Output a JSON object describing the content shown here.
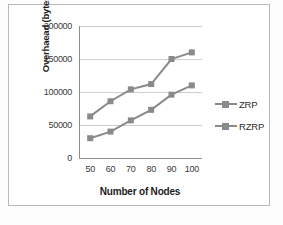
{
  "chart_data": {
    "type": "line",
    "title": "",
    "xlabel": "Number of Nodes",
    "ylabel": "Overhaead (bytes)",
    "categories": [
      "50",
      "60",
      "70",
      "80",
      "90",
      "100"
    ],
    "x": [
      50,
      60,
      70,
      80,
      90,
      100
    ],
    "ylim": [
      0,
      200000
    ],
    "yticks": [
      "0",
      "50000",
      "100000",
      "150000",
      "200000"
    ],
    "ytick_values": [
      0,
      50000,
      100000,
      150000,
      200000
    ],
    "grid": "horizontal",
    "legend_position": "right",
    "series": [
      {
        "name": "ZRP",
        "color": "#8a8a8a",
        "marker": "square",
        "values": [
          30000,
          40000,
          57000,
          73000,
          96000,
          110000
        ]
      },
      {
        "name": "RZRP",
        "color": "#8a8a8a",
        "marker": "square",
        "values": [
          63000,
          86000,
          104000,
          112000,
          150000,
          160000
        ]
      }
    ]
  },
  "legend": {
    "items": [
      {
        "label": "ZRP",
        "marker": "line-square-marker"
      },
      {
        "label": "RZRP",
        "marker": "line-square-marker"
      }
    ]
  }
}
